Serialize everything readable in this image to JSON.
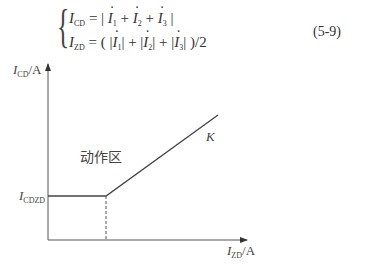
{
  "equations": {
    "line1": {
      "lhs": "I",
      "lhs_sub": "CD",
      "rhs_parts": [
        "= | ",
        " + ",
        " + ",
        " |"
      ],
      "terms": [
        {
          "symbol": "I",
          "sub": "1"
        },
        {
          "symbol": "I",
          "sub": "2"
        },
        {
          "symbol": "I",
          "sub": "3"
        }
      ]
    },
    "line2": {
      "lhs": "I",
      "lhs_sub": "ZD",
      "prefix": "= ( |",
      "sep1": "| + |",
      "sep2": "| + |",
      "suffix": "| )/2",
      "terms": [
        {
          "symbol": "I",
          "sub": "1"
        },
        {
          "symbol": "I",
          "sub": "2"
        },
        {
          "symbol": "I",
          "sub": "3"
        }
      ]
    },
    "number": "(5-9)"
  },
  "diagram": {
    "y_axis_label": {
      "symbol": "I",
      "sub": "CD",
      "unit": "/A"
    },
    "x_axis_label": {
      "symbol": "I",
      "sub": "ZD",
      "unit": "/A"
    },
    "threshold_label": {
      "symbol": "I",
      "sub": "CDZD"
    },
    "region_label": "动作区",
    "slope_label": "K"
  }
}
